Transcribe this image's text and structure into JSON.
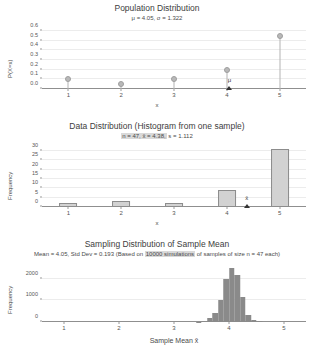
{
  "chart_data": [
    {
      "type": "bar",
      "plot_style": "stem",
      "title": "Population Distribution",
      "subtitle": "μ = 4.05, σ = 1.322",
      "xlabel": "x",
      "ylabel": "P(X=x)",
      "categories": [
        1,
        2,
        3,
        4,
        5
      ],
      "values": [
        0.1,
        0.05,
        0.1,
        0.2,
        0.55
      ],
      "xticks": [
        "1",
        "2",
        "3",
        "4",
        "5"
      ],
      "yticks": [
        "0.0",
        "0.1",
        "0.2",
        "0.3",
        "0.4",
        "0.5",
        "0.6"
      ],
      "ylim": [
        0,
        0.6
      ],
      "xlim": [
        0.5,
        5.5
      ],
      "grid": true,
      "legend": "none",
      "annotations": [
        {
          "label": "μ",
          "x": 4.05,
          "marker": "triangle-up"
        }
      ],
      "mean": 4.05,
      "sigma": 1.322
    },
    {
      "type": "bar",
      "plot_style": "histogram",
      "title": "Data Distribution (Histogram from one sample)",
      "subtitle_parts": [
        {
          "text": "n = 47, x̄ = 4.38,",
          "highlight": true
        },
        {
          "text": " s = 1.112",
          "highlight": false
        }
      ],
      "subtitle": "n = 47, x̄ = 4.38, s = 1.112",
      "xlabel": "x",
      "ylabel": "Frequency",
      "categories": [
        1,
        2,
        3,
        4,
        5
      ],
      "values": [
        2,
        3,
        2,
        9,
        31
      ],
      "xticks": [
        "1",
        "2",
        "3",
        "4",
        "5"
      ],
      "yticks": [
        "0",
        "5",
        "10",
        "15",
        "20",
        "25",
        "30"
      ],
      "ylim": [
        0,
        31
      ],
      "xlim": [
        0.5,
        5.5
      ],
      "grid": true,
      "legend": "none",
      "annotations": [
        {
          "label": "x̄",
          "x": 4.38,
          "marker": "triangle-up"
        }
      ],
      "n": 47,
      "sample_mean": 4.38,
      "sample_sd": 1.112
    },
    {
      "type": "bar",
      "plot_style": "histogram",
      "title": "Sampling Distribution of Sample Mean",
      "subtitle_parts": [
        {
          "text": "Mean = 4.05, Std Dev = 0.193 (Based on ",
          "highlight": false
        },
        {
          "text": "10000 simulations",
          "highlight": true
        },
        {
          "text": " of samples of size n = 47 each)",
          "highlight": false
        }
      ],
      "subtitle": "Mean = 4.05, Std Dev = 0.193 (Based on 10000 simulations of samples of size n = 47 each)",
      "xlabel": "Sample Mean x̄",
      "ylabel": "Frequency",
      "x": [
        3.45,
        3.55,
        3.65,
        3.75,
        3.85,
        3.95,
        4.05,
        4.15,
        4.25,
        4.35,
        4.45,
        4.55
      ],
      "values": [
        20,
        60,
        180,
        420,
        1020,
        1980,
        2520,
        2180,
        1150,
        330,
        110,
        30
      ],
      "bin_width": 0.1,
      "xticks": [
        "1",
        "2",
        "3",
        "4",
        "5"
      ],
      "yticks": [
        "0",
        "1000",
        "2000"
      ],
      "ylim": [
        0,
        2600
      ],
      "xlim": [
        0.6,
        5.4
      ],
      "grid": true,
      "legend": "none",
      "mean": 4.05,
      "std_dev": 0.193,
      "simulations": 10000,
      "sample_size": 47
    }
  ],
  "colors": {
    "bar_fill": "#d2d2d2",
    "bar_edge": "#8c8c8c",
    "sampling_bar": "#8a8a8a",
    "stem": "#b4b4b4",
    "grid": "#ececec",
    "axis": "#8f8f8f",
    "highlight": "#d9d9d9",
    "text": "#3d3d3d"
  }
}
